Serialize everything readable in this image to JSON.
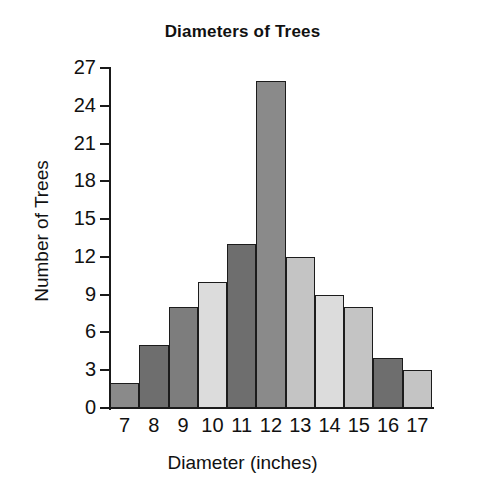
{
  "chart_data": {
    "type": "bar",
    "title": "Diameters of Trees",
    "xlabel": "Diameter (inches)",
    "ylabel": "Number of Trees",
    "categories": [
      "7",
      "8",
      "9",
      "10",
      "11",
      "12",
      "13",
      "14",
      "15",
      "16",
      "17"
    ],
    "values": [
      2,
      5,
      8,
      10,
      13,
      26,
      12,
      9,
      8,
      4,
      3
    ],
    "bar_colors": [
      "#8a8a8a",
      "#6e6e6e",
      "#7d7d7d",
      "#dcdcdc",
      "#6e6e6e",
      "#8a8a8a",
      "#c4c4c4",
      "#dcdcdc",
      "#c4c4c4",
      "#6e6e6e",
      "#c4c4c4",
      "#6e6e6e"
    ],
    "bar_border_color": "#1c1c1c",
    "ylim": [
      0,
      27
    ],
    "ytick_values": [
      0,
      3,
      6,
      9,
      12,
      15,
      18,
      21,
      24,
      27
    ],
    "ytick_labels": [
      "0",
      "3",
      "6",
      "9",
      "12",
      "15",
      "18",
      "21",
      "24",
      "27"
    ],
    "grid": false,
    "legend": "none",
    "background_color": "#ffffff",
    "axis_color": "#1a1a1a"
  }
}
